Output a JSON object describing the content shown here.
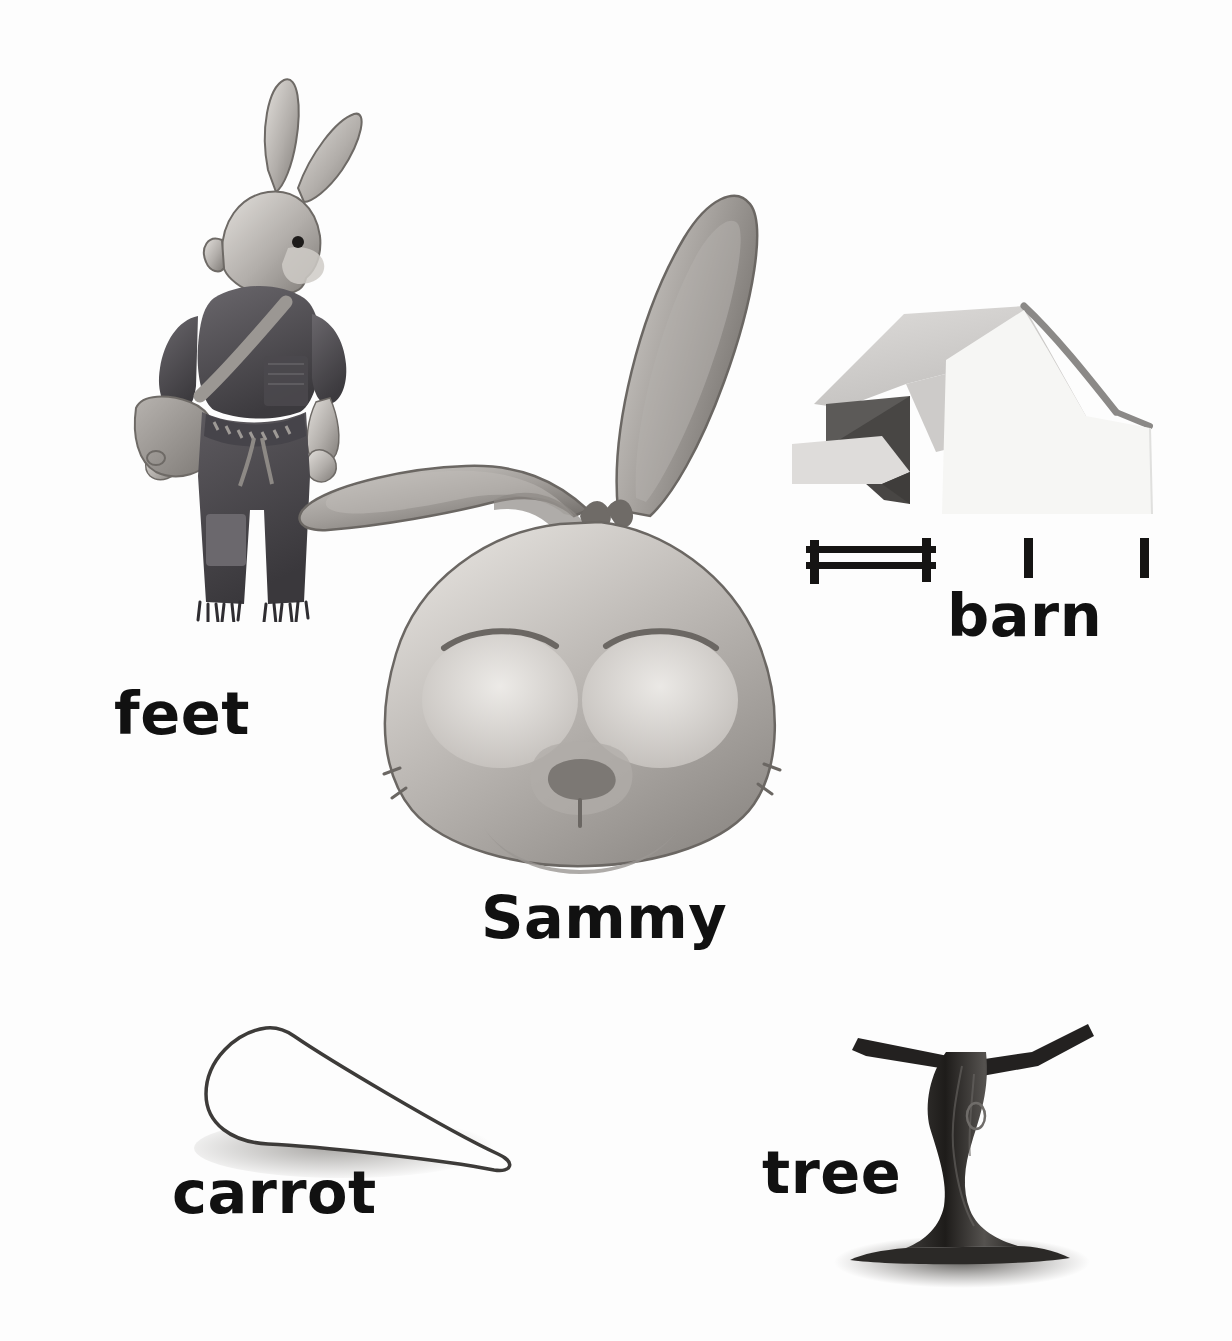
{
  "page": {
    "kind": "picture-vocabulary-worksheet",
    "background_color": "#fdfdfd",
    "text_color": "#111111",
    "width": 1232,
    "height": 1341
  },
  "labels": [
    {
      "id": "feet",
      "text": "feet",
      "icon": "bunny-standing-figure-icon",
      "description": "a cartoon rabbit standing in a t-shirt, satchel and patched frayed jeans"
    },
    {
      "id": "sammy",
      "text": "Sammy",
      "icon": "rabbit-head-icon",
      "description": "a large rabbit head with one upright ear and one folded ear, eyes closed"
    },
    {
      "id": "barn",
      "text": "barn",
      "icon": "barn-icon",
      "description": "a light grey gambrel-roof barn with a dark open doorway and a fence in front"
    },
    {
      "id": "carrot",
      "text": "carrot",
      "icon": "carrot-icon",
      "description": "a white outlined cone shaped carrot lying on its side with a soft shadow"
    },
    {
      "id": "tree",
      "text": "tree",
      "icon": "tree-icon",
      "description": "a dark bare tree trunk with two horizontal branches and a ground shadow"
    }
  ],
  "palette": {
    "ink": "#111111",
    "page": "#fdfdfd",
    "fur_light": "#d9d6d2",
    "fur_mid": "#a9a5a1",
    "fur_dark": "#6e6a66",
    "cloth_dark": "#58555a",
    "cloth_darker": "#3e3c40",
    "barn_wall": "#f2f2f0",
    "barn_roof": "#d2d2d0",
    "barn_shade": "#6a6a68",
    "barn_door": "#4a4a48",
    "tree_bark": "#2f2d2b",
    "shadow": "#b9b7b4"
  }
}
